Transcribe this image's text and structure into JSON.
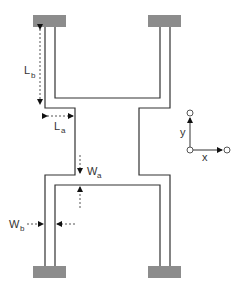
{
  "diagram": {
    "type": "mems-spring-schematic",
    "colors": {
      "anchor_fill": "#8c8c8c",
      "structure_stroke": "#333333",
      "dimension_stroke": "#555555",
      "label": "#333333"
    },
    "anchors": [
      {
        "id": "top-left",
        "x": 33,
        "y": 15,
        "w": 33,
        "h": 12
      },
      {
        "id": "top-right",
        "x": 148,
        "y": 15,
        "w": 33,
        "h": 12
      },
      {
        "id": "bottom-left",
        "x": 33,
        "y": 266,
        "w": 33,
        "h": 12
      },
      {
        "id": "bottom-right",
        "x": 148,
        "y": 266,
        "w": 33,
        "h": 12
      }
    ],
    "dimensions": {
      "Lb": {
        "main": "L",
        "sub": "b"
      },
      "La": {
        "main": "L",
        "sub": "a"
      },
      "Wa": {
        "main": "W",
        "sub": "a"
      },
      "Wb": {
        "main": "W",
        "sub": "b"
      }
    },
    "axes": {
      "x_label": "x",
      "y_label": "y"
    }
  }
}
